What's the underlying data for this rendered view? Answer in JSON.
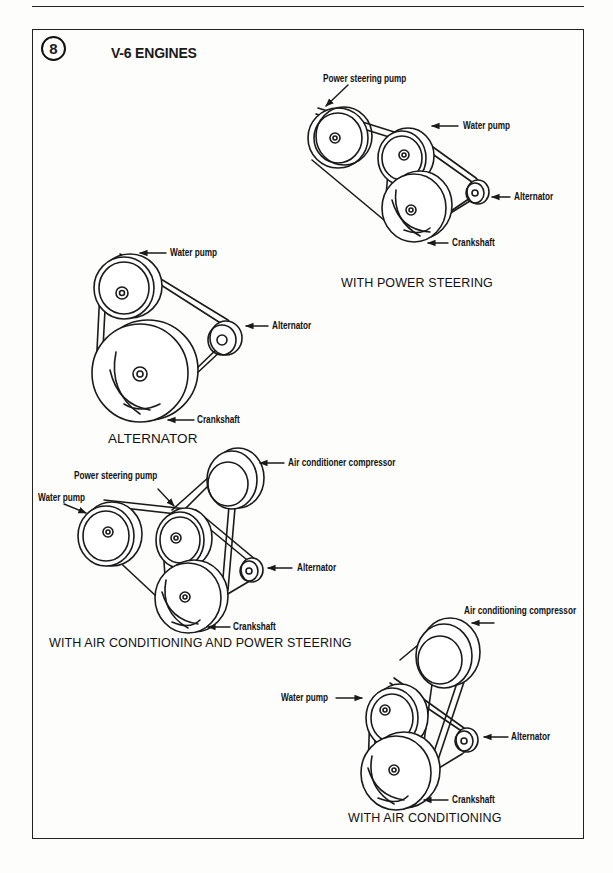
{
  "figure": {
    "number": "8",
    "title": "V-6 ENGINES"
  },
  "diagrams": [
    {
      "caption": "WITH POWER STEERING",
      "labels": [
        "Power steering pump",
        "Water pump",
        "Alternator",
        "Crankshaft"
      ]
    },
    {
      "caption": "ALTERNATOR",
      "labels": [
        "Water pump",
        "Alternator",
        "Crankshaft"
      ]
    },
    {
      "caption": "WITH AIR CONDITIONING AND POWER STEERING",
      "labels": [
        "Power steering pump",
        "Water pump",
        "Air conditioner compressor",
        "Alternator",
        "Crankshaft"
      ]
    },
    {
      "caption": "WITH AIR CONDITIONING",
      "labels": [
        "Air conditioning compressor",
        "Water pump",
        "Alternator",
        "Crankshaft"
      ]
    }
  ],
  "colors": {
    "ink": "#1a1a1a",
    "paper": "#fdfdfc"
  }
}
